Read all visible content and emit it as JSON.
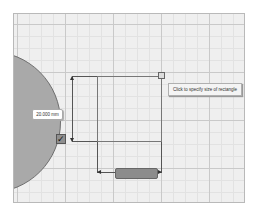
{
  "canvas": {
    "tooltip": "Click to specify size of rectangle",
    "height_dimension": "20.000 mm",
    "width_dimension": "",
    "confirm_icon": "checkmark-icon"
  },
  "colors": {
    "grid_background": "#efefef",
    "circle_fill": "#a9a9a9",
    "width_field_highlight": "#8c8c8c"
  }
}
